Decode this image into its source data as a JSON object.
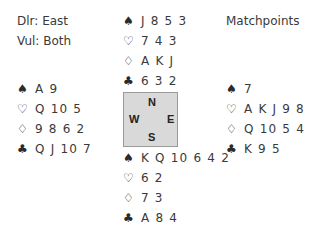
{
  "info": {
    "dealer": "Dlr: East",
    "vul": "Vul: Both",
    "scoring": "Matchpoints"
  },
  "icons": {
    "spade": "♠",
    "heart": "♡",
    "diamond": "♢",
    "club": "♣"
  },
  "hands": {
    "north": {
      "spades": "J 8 5 3",
      "hearts": "7 4 3",
      "diamonds": "A K J",
      "clubs": "6 3 2"
    },
    "west": {
      "spades": "A 9",
      "hearts": "Q 10 5",
      "diamonds": "9 8 6 2",
      "clubs": "Q J 10 7"
    },
    "east": {
      "spades": "7",
      "hearts": "A K J 9 8",
      "diamonds": "Q 10 5 4",
      "clubs": "K 9 5"
    },
    "south": {
      "spades": "K Q 10 6 4 2",
      "hearts": "6 2",
      "diamonds": "7 3",
      "clubs": "A 8 4"
    }
  },
  "compass": {
    "n": "N",
    "s": "S",
    "w": "W",
    "e": "E"
  },
  "colors": {
    "compass_bg": "#d9d9d9",
    "compass_border": "#9a9a9a",
    "text": "#3a3a3a"
  }
}
